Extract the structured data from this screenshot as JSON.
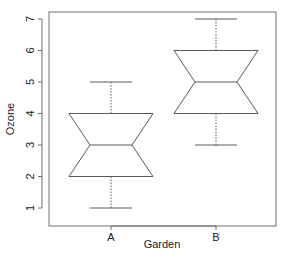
{
  "chart_data": {
    "type": "boxplot",
    "notched": true,
    "title": "",
    "xlabel": "Garden",
    "ylabel": "Ozone",
    "categories": [
      "A",
      "B"
    ],
    "ylim": [
      0.8,
      7.2
    ],
    "yticks": [
      1,
      2,
      3,
      4,
      5,
      6,
      7
    ],
    "grid": false,
    "legend": null,
    "series": [
      {
        "name": "A",
        "whisker_low": 1,
        "q1": 2,
        "median": 3,
        "q3": 4,
        "whisker_high": 5
      },
      {
        "name": "B",
        "whisker_low": 3,
        "q1": 4,
        "median": 5,
        "q3": 6,
        "whisker_high": 7
      }
    ],
    "style": {
      "line_color": "#5a5a5a",
      "frame_color": "#6e6e6e",
      "whisker_style": "dotted"
    }
  }
}
